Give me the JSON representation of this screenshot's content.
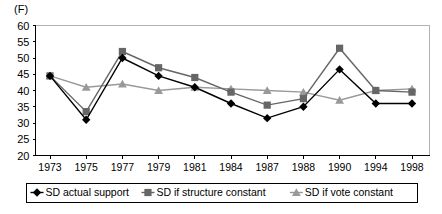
{
  "panel": {
    "label": "(F)"
  },
  "chart_data": {
    "type": "line",
    "title": "",
    "subtitle": "",
    "xlabel": "",
    "ylabel": "",
    "categories": [
      "1973",
      "1975",
      "1977",
      "1979",
      "1981",
      "1984",
      "1987",
      "1988",
      "1990",
      "1994",
      "1998"
    ],
    "series": [
      {
        "name": "SD actual support",
        "marker": "diamond",
        "color": "#000000",
        "values": [
          44.5,
          31.0,
          50.0,
          44.5,
          41.0,
          36.0,
          31.5,
          35.0,
          46.5,
          36.0,
          36.0
        ]
      },
      {
        "name": "SD if structure constant",
        "marker": "square",
        "color": "#666666",
        "values": [
          44.5,
          33.5,
          52.0,
          47.0,
          44.0,
          39.5,
          35.5,
          37.5,
          53.0,
          40.0,
          39.5
        ]
      },
      {
        "name": "SD if vote constant",
        "marker": "triangle",
        "color": "#999999",
        "values": [
          44.5,
          41.0,
          42.0,
          40.0,
          41.0,
          40.5,
          40.0,
          39.5,
          37.0,
          40.0,
          40.5
        ]
      }
    ],
    "ylim": [
      20,
      60
    ],
    "yticks": [
      20,
      25,
      30,
      35,
      40,
      45,
      50,
      55,
      60
    ],
    "xlim_index": [
      0,
      10
    ],
    "grid": false,
    "legend_position": "bottom"
  },
  "legend": {
    "items": [
      {
        "label": "SD actual support",
        "marker": "diamond-marker",
        "color": "#000000"
      },
      {
        "label": "SD if structure constant",
        "marker": "square-marker",
        "color": "#666666"
      },
      {
        "label": "SD if vote constant",
        "marker": "triangle-marker",
        "color": "#999999"
      }
    ]
  }
}
